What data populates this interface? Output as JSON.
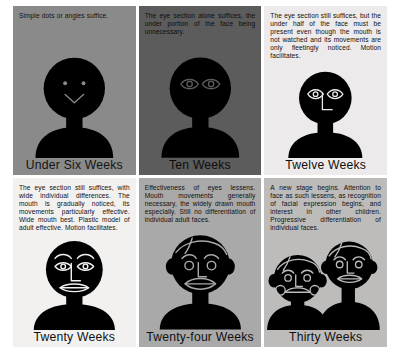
{
  "figure": {
    "panels": [
      {
        "id": "under-six-weeks",
        "caption": "Simple dots or angles suffice.",
        "label": "Under Six Weeks",
        "theme": "p-dark",
        "face": "dots-and-angle",
        "bg_color": "#8a8a8a",
        "ink_color": "#000000"
      },
      {
        "id": "ten-weeks",
        "caption": "The eye section alone suffices, the under portion of the face being unnecessary.",
        "label": "Ten Weeks",
        "theme": "p-darker",
        "face": "eyes-only",
        "bg_color": "#5c5c5c",
        "ink_color": "#000000"
      },
      {
        "id": "twelve-weeks",
        "caption": "The eye section still suffices, but the under half of the face must be present even though the mouth is not watched and its movements are only fleetingly noticed. Motion facilitates.",
        "label": "Twelve Weeks",
        "theme": "p-light",
        "face": "eyes-and-nose",
        "bg_color": "#eceaea",
        "ink_color": "#000000"
      },
      {
        "id": "twenty-weeks",
        "caption": "The eye section still suffices, with wide individual differences. The mouth is gradually noticed, its movements particularly effective. Wide mouth best. Plastic model of adult effective. Motion facilitates.",
        "label": "Twenty Weeks",
        "theme": "p-pale",
        "face": "brows-eyes-nose-mouth",
        "bg_color": "#f2f1f0",
        "ink_color": "#000000"
      },
      {
        "id": "twenty-four-weeks",
        "caption": "Effectiveness of eyes lessens. Mouth movements generally necessary, the widely drawn mouth especially. Still no differentiation of individual adult faces.",
        "label": "Twenty-four Weeks",
        "theme": "p-mid",
        "face": "full-head-with-hair",
        "bg_color": "#a9a9a9",
        "ink_color": "#000000"
      },
      {
        "id": "thirty-weeks",
        "caption": "A new stage begins. Attention to face as such lessens, as recognition of facial expression begins, and interest in other children. Progressive differentiation of individual faces.",
        "label": "Thirty Weeks",
        "theme": "p-mid2",
        "face": "two-children",
        "bg_color": "#bdbcbb",
        "ink_color": "#000000"
      }
    ]
  }
}
